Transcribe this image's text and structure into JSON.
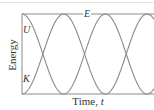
{
  "chart_data": {
    "type": "line",
    "title": "",
    "xlabel": "Time, t",
    "ylabel": "Energy",
    "x_label_main": "Time, ",
    "x_label_var": "t",
    "series": [
      {
        "name": "E",
        "label": "E",
        "description": "Total energy (constant)",
        "values": [
          1,
          1,
          1,
          1,
          1,
          1,
          1,
          1,
          1
        ]
      },
      {
        "name": "U",
        "label": "U",
        "description": "Potential energy, starts at maximum",
        "x": [
          0,
          0.5,
          1,
          1.5,
          2,
          2.5,
          3,
          3.5,
          4
        ],
        "values": [
          1,
          0.5,
          0,
          0.5,
          1,
          0.5,
          0,
          0.5,
          1
        ]
      },
      {
        "name": "K",
        "label": "K",
        "description": "Kinetic energy, starts at zero",
        "x": [
          0,
          0.5,
          1,
          1.5,
          2,
          2.5,
          3,
          3.5,
          4
        ],
        "values": [
          0,
          0.5,
          1,
          0.5,
          0,
          0.5,
          1,
          0.5,
          0
        ]
      }
    ],
    "x_units": "half-periods",
    "ylim": [
      0,
      1
    ],
    "xlim": [
      0,
      3.1
    ],
    "grid": false,
    "legend": "inline labels",
    "colors": {
      "curves": "#8a8a8a",
      "axes": "#8a8a8a",
      "text": "#333333"
    }
  }
}
